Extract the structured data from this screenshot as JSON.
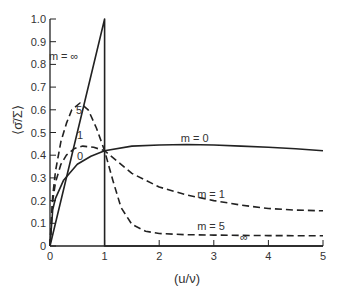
{
  "chart_data": {
    "type": "line",
    "title": "",
    "xlabel": "(u/ν)",
    "ylabel": "⟨σ̄/Σ⟩",
    "xlim": [
      0,
      5
    ],
    "ylim": [
      0,
      1.0
    ],
    "grid": false,
    "legend_position": "inline labels",
    "x_ticks": [
      "0",
      "1",
      "2",
      "3",
      "4",
      "5"
    ],
    "y_ticks": [
      "0",
      "0.1",
      "0.2",
      "0.3",
      "0.4",
      "0.5",
      "0.6",
      "0.7",
      "0.8",
      "0.9",
      "1.0"
    ],
    "series": [
      {
        "name": "m = 0",
        "style": "solid",
        "label": "m = 0",
        "x": [
          0,
          0.05,
          0.1,
          0.25,
          0.5,
          0.75,
          1,
          1.5,
          2,
          2.5,
          3,
          3.5,
          4,
          4.5,
          5
        ],
        "y": [
          0,
          0.16,
          0.21,
          0.29,
          0.36,
          0.395,
          0.42,
          0.44,
          0.445,
          0.447,
          0.445,
          0.44,
          0.435,
          0.428,
          0.42
        ]
      },
      {
        "name": "m = 1",
        "style": "dashed",
        "label": "m = 1",
        "x": [
          0,
          0.05,
          0.1,
          0.2,
          0.3,
          0.45,
          0.6,
          0.8,
          1,
          1.25,
          1.5,
          2,
          2.5,
          3,
          3.5,
          4,
          4.5,
          5
        ],
        "y": [
          0,
          0.2,
          0.28,
          0.36,
          0.4,
          0.43,
          0.44,
          0.435,
          0.42,
          0.37,
          0.32,
          0.26,
          0.225,
          0.2,
          0.18,
          0.165,
          0.158,
          0.155
        ]
      },
      {
        "name": "m = 5",
        "style": "dashed",
        "label": "m = 5",
        "x": [
          0,
          0.05,
          0.1,
          0.2,
          0.3,
          0.4,
          0.55,
          0.7,
          0.85,
          1,
          1.15,
          1.3,
          1.5,
          1.75,
          2,
          2.5,
          3,
          4,
          5
        ],
        "y": [
          0,
          0.22,
          0.33,
          0.46,
          0.54,
          0.6,
          0.63,
          0.6,
          0.52,
          0.42,
          0.29,
          0.17,
          0.095,
          0.065,
          0.055,
          0.05,
          0.048,
          0.046,
          0.045
        ]
      },
      {
        "name": "m = ∞",
        "style": "solid",
        "label": "m = ∞",
        "x": [
          0,
          1,
          1,
          5
        ],
        "y": [
          0,
          1.0,
          0,
          0
        ]
      }
    ],
    "annotations": [
      {
        "text": "m = ∞",
        "x": 0.25,
        "y": 0.82
      },
      {
        "text": "5",
        "x": 0.53,
        "y": 0.58
      },
      {
        "text": "1",
        "x": 0.55,
        "y": 0.47
      },
      {
        "text": "0",
        "x": 0.55,
        "y": 0.38
      },
      {
        "text": "m = 0",
        "x": 2.65,
        "y": 0.46
      },
      {
        "text": "m = 1",
        "x": 2.95,
        "y": 0.21
      },
      {
        "text": "m = 5",
        "x": 2.95,
        "y": 0.07
      },
      {
        "text": "∞",
        "x": 3.55,
        "y": 0.02
      }
    ]
  }
}
